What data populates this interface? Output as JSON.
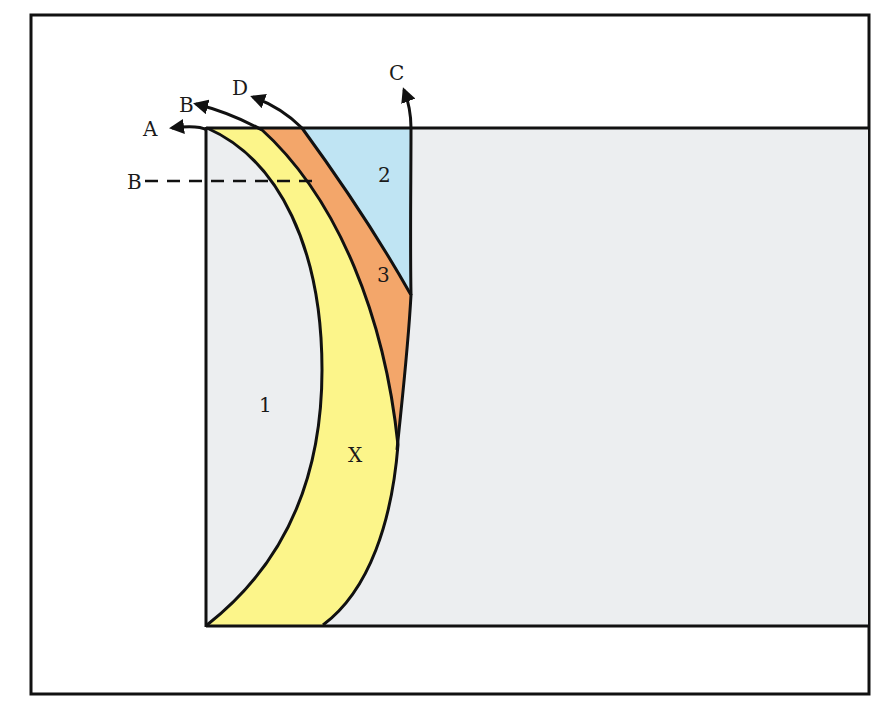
{
  "diagram": {
    "colors": {
      "background": "#ffffff",
      "frame": "#111111",
      "region_1_gray": "#eceef0",
      "region_x_yellow": "#fcf58a",
      "region_3_orange": "#f3a66a",
      "region_2_blue": "#bfe4f3"
    },
    "regions": [
      {
        "id": "1",
        "label": "1",
        "color": "gray"
      },
      {
        "id": "2",
        "label": "2",
        "color": "blue"
      },
      {
        "id": "3",
        "label": "3",
        "color": "orange"
      },
      {
        "id": "X",
        "label": "X",
        "color": "yellow"
      }
    ],
    "arrows": [
      {
        "id": "A",
        "label": "A"
      },
      {
        "id": "B",
        "label": "B"
      },
      {
        "id": "D",
        "label": "D"
      },
      {
        "id": "C",
        "label": "C"
      }
    ],
    "section_line": {
      "label": "B",
      "style": "dashed"
    }
  }
}
